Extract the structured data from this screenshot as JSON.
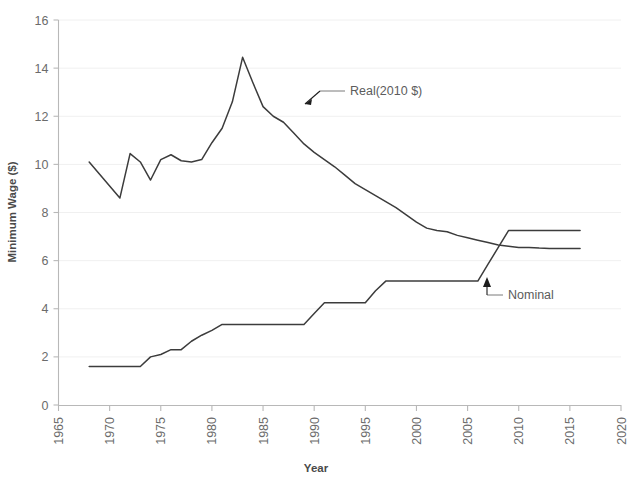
{
  "chart_data": {
    "type": "line",
    "title": "",
    "xlabel": "Year",
    "ylabel": "Minimum Wage ($)",
    "xlim": [
      1965,
      2020
    ],
    "ylim": [
      0,
      16
    ],
    "xticks": [
      "1965",
      "1970",
      "1975",
      "1980",
      "1985",
      "1990",
      "1995",
      "2000",
      "2005",
      "2010",
      "2015",
      "2020"
    ],
    "yticks": [
      "0",
      "2",
      "4",
      "6",
      "8",
      "10",
      "12",
      "14",
      "16"
    ],
    "grid": "horizontal-only",
    "legend_position": "inline-annotations",
    "annotations": [
      {
        "name": "real-series-label",
        "text": "Real(2010 $)",
        "points_to_year": 1989,
        "points_to_value": 12.05
      },
      {
        "name": "nominal-series-label",
        "text": "Nominal",
        "points_to_year": 2007,
        "points_to_value": 5.85
      }
    ],
    "series": [
      {
        "name": "Real(2010 $)",
        "x": [
          1968,
          1969,
          1970,
          1971,
          1972,
          1973,
          1974,
          1975,
          1976,
          1977,
          1978,
          1979,
          1980,
          1981,
          1982,
          1983,
          1984,
          1985,
          1986,
          1987,
          1988,
          1989,
          1990,
          1991,
          1992,
          1993,
          1994,
          1995,
          1996,
          1997,
          1998,
          1999,
          2000,
          2001,
          2002,
          2003,
          2004,
          2005,
          2006,
          2007,
          2008,
          2009,
          2010,
          2011,
          2012,
          2013,
          2014,
          2015,
          2016
        ],
        "values": [
          10.1,
          9.6,
          9.1,
          8.6,
          10.45,
          10.1,
          9.35,
          10.2,
          10.4,
          10.15,
          10.1,
          10.2,
          10.9,
          11.5,
          12.6,
          14.45,
          13.4,
          12.4,
          12.0,
          11.75,
          11.3,
          10.85,
          10.5,
          10.2,
          9.9,
          9.55,
          9.2,
          8.95,
          8.7,
          8.45,
          8.2,
          7.9,
          7.6,
          7.35,
          7.25,
          7.2,
          7.05,
          6.95,
          6.85,
          6.75,
          6.65,
          6.6,
          6.55,
          6.55,
          6.52,
          6.5,
          6.5,
          6.5,
          6.5
        ]
      },
      {
        "name": "Nominal",
        "x": [
          1968,
          1969,
          1970,
          1971,
          1972,
          1973,
          1974,
          1975,
          1976,
          1977,
          1978,
          1979,
          1980,
          1981,
          1982,
          1983,
          1984,
          1985,
          1986,
          1987,
          1988,
          1989,
          1990,
          1991,
          1992,
          1993,
          1994,
          1995,
          1996,
          1997,
          1998,
          1999,
          2000,
          2001,
          2002,
          2003,
          2004,
          2005,
          2006,
          2007,
          2008,
          2009,
          2010,
          2011,
          2012,
          2013,
          2014,
          2015,
          2016
        ],
        "values": [
          1.6,
          1.6,
          1.6,
          1.6,
          1.6,
          1.6,
          2.0,
          2.1,
          2.3,
          2.3,
          2.65,
          2.9,
          3.1,
          3.35,
          3.35,
          3.35,
          3.35,
          3.35,
          3.35,
          3.35,
          3.35,
          3.35,
          3.8,
          4.25,
          4.25,
          4.25,
          4.25,
          4.25,
          4.75,
          5.15,
          5.15,
          5.15,
          5.15,
          5.15,
          5.15,
          5.15,
          5.15,
          5.15,
          5.15,
          5.85,
          6.55,
          7.25,
          7.25,
          7.25,
          7.25,
          7.25,
          7.25,
          7.25,
          7.25
        ]
      }
    ]
  },
  "colors": {
    "line": "#3c3c3c",
    "grid": "#f0f0f0",
    "axis": "#b8b8b8",
    "tick_text": "#6b6b6b",
    "axis_title": "#4a4a4a",
    "annotation_text": "#5c5c5c",
    "background": "#ffffff"
  }
}
